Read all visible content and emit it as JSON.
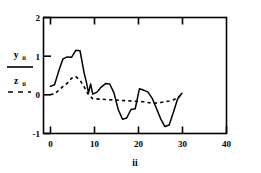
{
  "chart_data": {
    "type": "line",
    "title": "",
    "xlabel": "ii",
    "ylabel": "",
    "xlim": [
      -1.6,
      41.5
    ],
    "ylim": [
      -1,
      2
    ],
    "xticks": [
      0,
      10,
      20,
      30,
      40
    ],
    "xticklabels": [
      "0",
      "10",
      "20",
      "30",
      "40"
    ],
    "yticks": [
      -1,
      0,
      1,
      2
    ],
    "yticklabels": [
      "-1",
      "0",
      "1",
      "2"
    ],
    "grid": false,
    "legend_position": "outside-left",
    "frame": "box",
    "series": [
      {
        "name": "y_ii",
        "label_main": "y",
        "label_sub": "ii",
        "style": "solid",
        "color": "#000000",
        "x": [
          0,
          1,
          2,
          3,
          4,
          5,
          6,
          7,
          8,
          8.5,
          9,
          9.5,
          10,
          11,
          12,
          13,
          14,
          15,
          16,
          17,
          18,
          19,
          20,
          21,
          22,
          23,
          24,
          25,
          26,
          27,
          28,
          29,
          30,
          31
        ],
        "values": [
          0.22,
          0.26,
          0.62,
          0.93,
          0.98,
          0.97,
          1.15,
          1.14,
          0.55,
          0.33,
          0.05,
          0.28,
          0.02,
          0.07,
          0.2,
          0.29,
          0.28,
          0.05,
          -0.38,
          -0.63,
          -0.6,
          -0.38,
          -0.36,
          0.16,
          0.12,
          0.07,
          -0.09,
          -0.35,
          -0.62,
          -0.82,
          -0.78,
          -0.45,
          -0.1,
          0.04
        ]
      },
      {
        "name": "z_ii",
        "label_main": "z",
        "label_sub": "ii",
        "style": "dashed",
        "color": "#000000",
        "x": [
          0,
          1,
          2,
          3,
          4,
          5,
          6,
          7,
          8,
          9,
          10,
          22,
          23,
          24,
          25,
          26,
          27,
          28,
          29,
          30,
          31
        ],
        "values": [
          0.01,
          0.02,
          0.12,
          0.22,
          0.3,
          0.43,
          0.47,
          0.38,
          0.2,
          0.0,
          -0.1,
          -0.18,
          -0.2,
          -0.22,
          -0.21,
          -0.2,
          -0.18,
          -0.16,
          -0.13,
          -0.08,
          0.03
        ]
      }
    ]
  },
  "legend": {
    "entry_y_main": "y",
    "entry_y_sub": "ii",
    "entry_z_main": "z",
    "entry_z_sub": "ii"
  },
  "axis": {
    "x_title": "ii"
  }
}
